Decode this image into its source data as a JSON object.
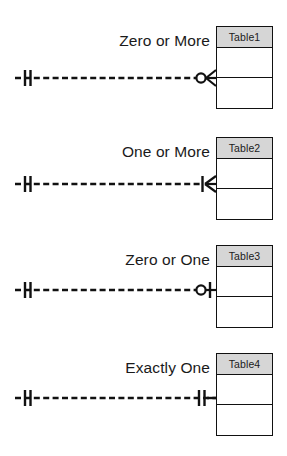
{
  "diagram": {
    "type": "entity-relationship-crows-foot-legend",
    "colors": {
      "line": "#111111",
      "table_border": "#111111",
      "table_header_fill": "#d6d6d6",
      "table_body_fill": "#ffffff",
      "text": "#1a1a1a",
      "background": "#ffffff"
    },
    "relationships": [
      {
        "label": "Zero or More",
        "table_name": "Table1",
        "left_symbol": "one-and-only-one",
        "right_symbol": "zero-or-more",
        "line_style": "dashed"
      },
      {
        "label": "One or More",
        "table_name": "Table2",
        "left_symbol": "one-and-only-one",
        "right_symbol": "one-or-more",
        "line_style": "dashed"
      },
      {
        "label": "Zero or One",
        "table_name": "Table3",
        "left_symbol": "one-and-only-one",
        "right_symbol": "zero-or-one",
        "line_style": "dashed"
      },
      {
        "label": "Exactly One",
        "table_name": "Table4",
        "left_symbol": "one-and-only-one",
        "right_symbol": "exactly-one",
        "line_style": "dashed"
      }
    ]
  }
}
